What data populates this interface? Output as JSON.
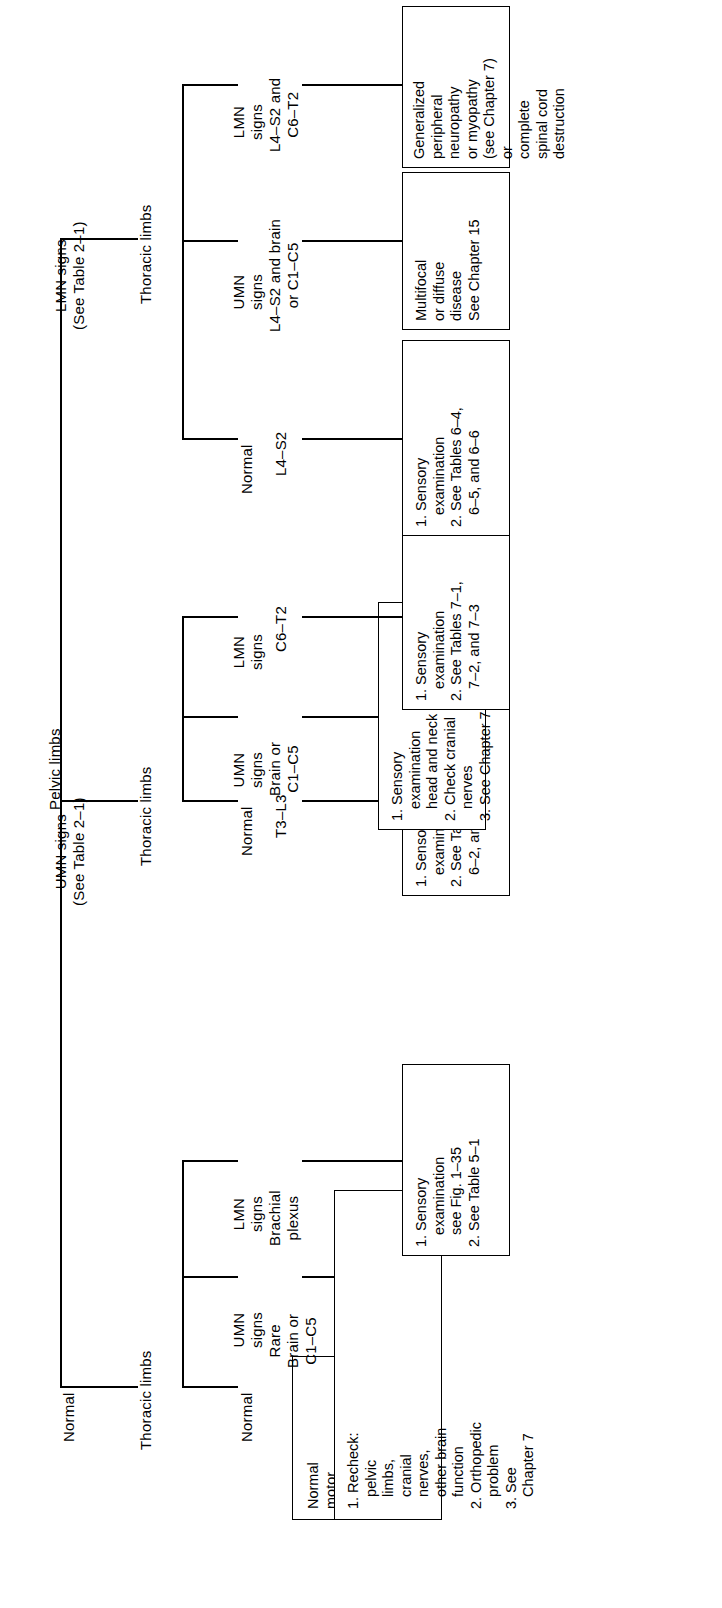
{
  "diagram": {
    "type": "decision-tree-flowchart",
    "orientation": "rotated-90-ccw",
    "root": "Pelvic limbs",
    "level1": [
      {
        "id": "normal",
        "label": "Normal"
      },
      {
        "id": "umn",
        "label": "UMN signs\n(See Table 2–1)"
      },
      {
        "id": "lmn",
        "label": "LMN signs\n(See Table 2–1)"
      }
    ],
    "level2": [
      {
        "id": "normal-thoracic",
        "label": "Thoracic limbs"
      },
      {
        "id": "umn-thoracic",
        "label": "Thoracic limbs"
      },
      {
        "id": "lmn-thoracic",
        "label": "Thoracic limbs"
      }
    ],
    "branches": [
      {
        "id": "b1",
        "group": "normal",
        "sign": "Normal",
        "localization": "",
        "box": "Normal\nmotor\nfunction\nof spinal\ncord"
      },
      {
        "id": "b2",
        "group": "normal",
        "sign": "UMN\nsigns",
        "localization": "Rare\nBrain or\nC1–C5",
        "box": "1. Recheck:\n   pelvic\n   limbs,\n   cranial\n   nerves,\n   other brain\n   function\n2. Orthopedic\n   problem\n3. See\n   Chapter 7"
      },
      {
        "id": "b3",
        "group": "normal",
        "sign": "LMN\nsigns",
        "localization": "Brachial\nplexus",
        "box": "1. Sensory\n   examination\n   see Fig. 1–35\n2. See Table 5–1"
      },
      {
        "id": "b4",
        "group": "umn",
        "sign": "Normal",
        "localization": "T3–L3",
        "box": "1. Sensory\n   examination\n2. See Tables 6–1,\n   6–2, and 6–3"
      },
      {
        "id": "b5",
        "group": "umn",
        "sign": "UMN\nsigns",
        "localization": "Brain or\nC1–C5",
        "box": "1. Sensory\n   examination\n   head and neck\n2. Check cranial\n   nerves\n3. See Chapter 7"
      },
      {
        "id": "b6",
        "group": "umn",
        "sign": "LMN\nsigns",
        "localization": "C6–T2",
        "box": "1. Sensory\n   examination\n2. See Tables 7–1,\n   7–2, and 7–3"
      },
      {
        "id": "b7",
        "group": "lmn",
        "sign": "Normal",
        "localization": "L4–S2",
        "box": "1. Sensory\n   examination\n2. See Tables 6–4,\n   6–5, and 6–6"
      },
      {
        "id": "b8",
        "group": "lmn",
        "sign": "UMN\nsigns",
        "localization": "L4–S2 and brain\nor C1–C5",
        "box": "Multifocal\nor diffuse\ndisease\nSee Chapter 15"
      },
      {
        "id": "b9",
        "group": "lmn",
        "sign": "LMN\nsigns",
        "localization": "L4–S2 and\nC6–T2",
        "box": "Generalized\nperipheral\nneuropathy\nor myopathy\n(see Chapter 7)\nor\ncomplete\nspinal cord\ndestruction"
      }
    ],
    "colors": {
      "line": "#000000",
      "text": "#000000",
      "background": "#ffffff"
    }
  }
}
